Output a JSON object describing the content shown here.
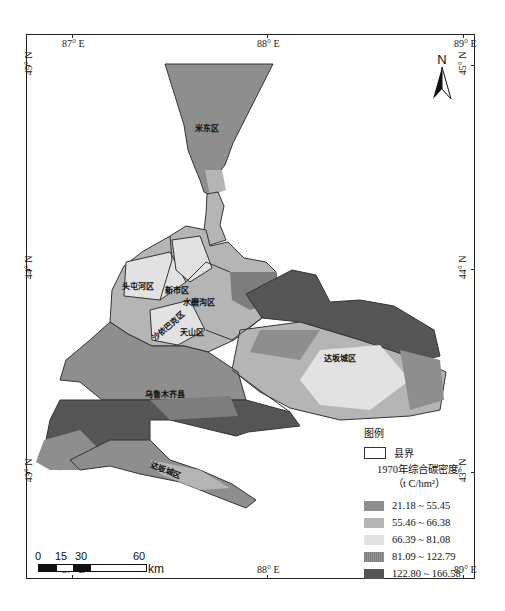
{
  "map": {
    "title_legend": "图例",
    "boundary_label": "县界",
    "legend_heading_line1": "1970年综合碳密度/",
    "legend_heading_line2": "（t C/hm²）",
    "classes": [
      {
        "label": "21.18 ~ 55.45",
        "color": "#8e8e8e"
      },
      {
        "label": "55.46 ~ 66.38",
        "color": "#b5b5b5"
      },
      {
        "label": "66.39 ~ 81.08",
        "color": "#e2e2e2"
      },
      {
        "label": "81.09 ~ 122.79",
        "color": "#7d7d7d"
      },
      {
        "label": "122.80 ~ 166.58",
        "color": "#555555"
      }
    ],
    "graticule": {
      "top": [
        "87° E",
        "88° E",
        "89° E"
      ],
      "bottom": [
        "87° E",
        "88° E",
        "89° E"
      ],
      "left": [
        "45° N",
        "44° N",
        "43° N"
      ],
      "right": [
        "45° N",
        "44° N",
        "43° N"
      ]
    },
    "districts": [
      {
        "name": "米东区"
      },
      {
        "name": "头屯河区"
      },
      {
        "name": "新市区"
      },
      {
        "name": "水磨沟区"
      },
      {
        "name": "沙依巴克区"
      },
      {
        "name": "天山区"
      },
      {
        "name": "达坂城区"
      },
      {
        "name": "乌鲁木齐县"
      },
      {
        "name": "达坂城区"
      }
    ],
    "scale_bar": {
      "ticks": [
        "0",
        "15",
        "30",
        "60"
      ],
      "unit": "km"
    },
    "north_arrow": {
      "label": "N"
    }
  }
}
